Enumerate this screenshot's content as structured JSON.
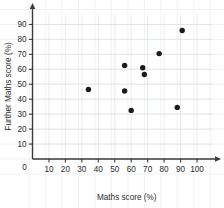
{
  "chart_data": {
    "type": "scatter",
    "title": "",
    "xlabel": "Maths score (%)",
    "ylabel": "Further Maths score (%)",
    "xlim": [
      0,
      105
    ],
    "ylim": [
      0,
      95
    ],
    "xticks": [
      10,
      20,
      30,
      40,
      50,
      60,
      70,
      80,
      90,
      100
    ],
    "yticks": [
      10,
      20,
      30,
      40,
      50,
      60,
      70,
      80,
      90
    ],
    "origin_label": "0",
    "grid": true,
    "legend": null,
    "marker_color": "#1b1b1b",
    "axis_color": "#3a3a3a",
    "grid_color": "#d9dde4",
    "points": [
      {
        "x": 34,
        "y": 46.5
      },
      {
        "x": 56,
        "y": 62.5
      },
      {
        "x": 56,
        "y": 45.5
      },
      {
        "x": 60,
        "y": 32.5
      },
      {
        "x": 67,
        "y": 61.0
      },
      {
        "x": 68,
        "y": 56.5
      },
      {
        "x": 77,
        "y": 70.5
      },
      {
        "x": 88,
        "y": 34.5
      },
      {
        "x": 91,
        "y": 86.0
      }
    ]
  }
}
